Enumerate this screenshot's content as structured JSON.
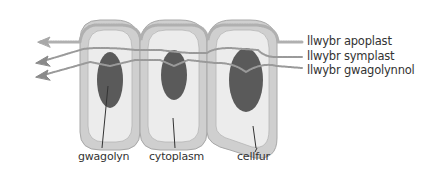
{
  "diagram": {
    "title": "",
    "pathways": [
      {
        "id": "apoplast",
        "label": "llwybr apoplast"
      },
      {
        "id": "symplast",
        "label": "llwybr symplast"
      },
      {
        "id": "vacuolar",
        "label": "llwybr gwagolynnol"
      }
    ],
    "parts": [
      {
        "id": "vacuole",
        "label": "gwagolyn"
      },
      {
        "id": "cytoplasm",
        "label": "cytoplasm"
      },
      {
        "id": "cell-wall",
        "label": "cellfur"
      }
    ],
    "cell_count": 3,
    "colors": {
      "background": "#ffffff",
      "cell_wall": "#cfcfcf",
      "cell_wall_stroke": "#a8a8a8",
      "cytoplasm": "#ececec",
      "vacuole": "#5a5a5a",
      "pathway": "#9a9a9a",
      "arrow": "#a0a0a0",
      "text": "#333333"
    }
  }
}
